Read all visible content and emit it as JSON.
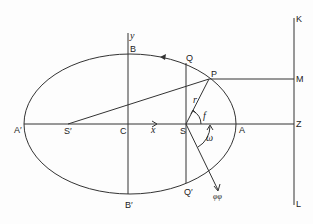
{
  "diagram": {
    "type": "ellipse-orbit-geometry",
    "labels": {
      "A_prime": "A′",
      "A": "A",
      "B": "B",
      "B_prime": "B′",
      "C": "C",
      "S": "S",
      "S_prime": "S′",
      "P": "P",
      "Q": "Q",
      "Q_prime": "Q′",
      "K": "K",
      "L": "L",
      "M": "M",
      "Z": "Z",
      "x": "x",
      "y": "y",
      "r": "r",
      "f": "f",
      "omega": "ω",
      "phi": "φφ"
    },
    "colors": {
      "stroke": "#333333",
      "text": "#222222",
      "background": "#fdfdfd"
    }
  }
}
